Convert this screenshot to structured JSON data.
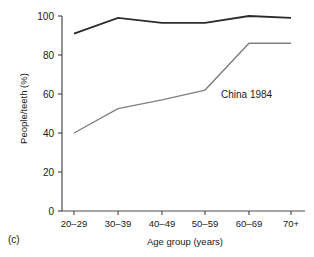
{
  "figure": {
    "panel_label": "(c)"
  },
  "chart_data": {
    "type": "line",
    "title": "",
    "xlabel": "Age group (years)",
    "ylabel": "People/teeth (%)",
    "categories": [
      "20–29",
      "30–39",
      "40–49",
      "50–59",
      "60–69",
      "70+"
    ],
    "ylim": [
      0,
      100
    ],
    "yticks": [
      0,
      20,
      40,
      60,
      80,
      100
    ],
    "ytick_labels": [
      "0",
      "20",
      "40",
      "60",
      "80",
      "100"
    ],
    "grid": false,
    "legend": "none",
    "annotations": [
      {
        "text": "China 1984",
        "x_category": "60–69",
        "y_value": 58
      }
    ],
    "series": [
      {
        "name": "People",
        "color": "#2b2b2b",
        "width": 1.8,
        "values": [
          91,
          99,
          96.5,
          96.5,
          100,
          99
        ]
      },
      {
        "name": "Teeth",
        "color": "#808080",
        "width": 1.4,
        "values": [
          40,
          52.5,
          57,
          62,
          86,
          86
        ]
      }
    ]
  }
}
